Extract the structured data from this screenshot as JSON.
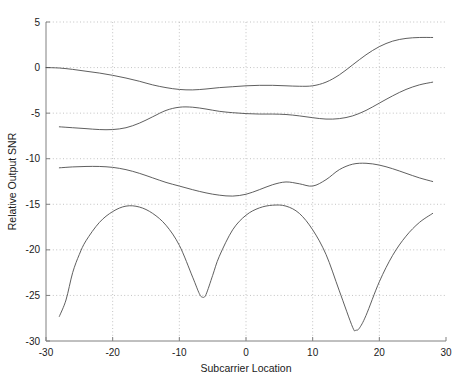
{
  "chart_data": {
    "type": "line",
    "title": "",
    "xlabel": "Subcarrier Location",
    "ylabel": "Relative Output SNR",
    "xlim": [
      -30,
      30
    ],
    "ylim": [
      -30,
      5
    ],
    "xticks": [
      -30,
      -20,
      -10,
      0,
      10,
      20,
      30
    ],
    "xticklabels": [
      "-30",
      "-20",
      "-10",
      "0",
      "10",
      "20",
      "30"
    ],
    "yticks": [
      -30,
      -25,
      -20,
      -15,
      -10,
      -5,
      0,
      5
    ],
    "yticklabels": [
      "-30",
      "-25",
      "-20",
      "-15",
      "-10",
      "-5",
      "0",
      "5"
    ],
    "grid": true,
    "grid_style": "dotted",
    "legend": "none",
    "line_color": "#4d4d4d",
    "axis_color": "#808080",
    "grid_color": "#b4b4b4",
    "background": "#ffffff",
    "series": [
      {
        "name": "curve-1",
        "x": [
          -30,
          -28,
          -26,
          -24,
          -22,
          -20,
          -18,
          -16,
          -14,
          -12,
          -10,
          -8,
          -6,
          -4,
          -2,
          0,
          2,
          4,
          6,
          8,
          10,
          12,
          14,
          16,
          18,
          20,
          22,
          24,
          26,
          28
        ],
        "y": [
          0.0,
          -0.05,
          -0.2,
          -0.4,
          -0.6,
          -0.85,
          -1.15,
          -1.5,
          -1.9,
          -2.2,
          -2.4,
          -2.45,
          -2.35,
          -2.2,
          -2.1,
          -2.0,
          -1.95,
          -1.95,
          -2.0,
          -2.05,
          -2.0,
          -1.6,
          -0.8,
          0.3,
          1.4,
          2.3,
          2.9,
          3.2,
          3.3,
          3.3
        ]
      },
      {
        "name": "curve-2",
        "x": [
          -28,
          -26,
          -24,
          -22,
          -20,
          -18,
          -16,
          -14,
          -12,
          -10,
          -8,
          -6,
          -4,
          -2,
          0,
          2,
          4,
          6,
          8,
          10,
          12,
          14,
          16,
          18,
          20,
          22,
          24,
          26,
          28
        ],
        "y": [
          -6.5,
          -6.6,
          -6.7,
          -6.8,
          -6.8,
          -6.6,
          -6.1,
          -5.4,
          -4.7,
          -4.35,
          -4.35,
          -4.55,
          -4.8,
          -4.95,
          -5.05,
          -5.1,
          -5.1,
          -5.15,
          -5.3,
          -5.5,
          -5.65,
          -5.6,
          -5.3,
          -4.7,
          -3.9,
          -3.1,
          -2.4,
          -1.9,
          -1.6
        ]
      },
      {
        "name": "curve-3",
        "x": [
          -28,
          -26,
          -24,
          -22,
          -20,
          -18,
          -16,
          -14,
          -12,
          -10,
          -8,
          -6,
          -4,
          -2,
          0,
          2,
          4,
          6,
          8,
          10,
          12,
          14,
          16,
          18,
          20,
          22,
          24,
          26,
          28
        ],
        "y": [
          -11.0,
          -10.9,
          -10.85,
          -10.85,
          -10.95,
          -11.2,
          -11.6,
          -12.1,
          -12.6,
          -13.0,
          -13.4,
          -13.75,
          -14.0,
          -14.1,
          -13.9,
          -13.4,
          -12.85,
          -12.55,
          -12.75,
          -13.0,
          -12.3,
          -11.2,
          -10.6,
          -10.5,
          -10.7,
          -11.1,
          -11.6,
          -12.1,
          -12.5
        ]
      },
      {
        "name": "curve-4",
        "x": [
          -28,
          -27,
          -26,
          -25,
          -24,
          -22,
          -20,
          -18,
          -16,
          -14,
          -12,
          -10,
          -8,
          -7,
          -6.5,
          -6,
          -5,
          -4,
          -2,
          0,
          2,
          4,
          6,
          8,
          10,
          12,
          14,
          16,
          16.5,
          17,
          18,
          20,
          22,
          24,
          26,
          28
        ],
        "y": [
          -27.3,
          -25.5,
          -22.5,
          -20.5,
          -19.0,
          -17.0,
          -15.8,
          -15.2,
          -15.3,
          -16.0,
          -17.3,
          -19.5,
          -23.0,
          -24.8,
          -25.2,
          -24.9,
          -22.8,
          -20.7,
          -17.8,
          -16.2,
          -15.4,
          -15.1,
          -15.2,
          -16.0,
          -17.8,
          -20.5,
          -24.5,
          -28.5,
          -28.8,
          -28.6,
          -27.2,
          -23.5,
          -20.6,
          -18.5,
          -17.0,
          -16.0
        ]
      }
    ]
  }
}
